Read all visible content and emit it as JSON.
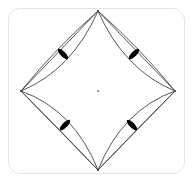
{
  "diagram": {
    "type": "geometric-figure",
    "vertices": {
      "top": [
        98,
        11
      ],
      "right": [
        175,
        91
      ],
      "bottom": [
        98,
        170
      ],
      "left": [
        21,
        91
      ]
    },
    "center_point": [
      98,
      91
    ],
    "lens_markers": [
      {
        "position": "top-left",
        "center": [
          63,
          54
        ]
      },
      {
        "position": "top-right",
        "center": [
          134,
          54
        ]
      },
      {
        "position": "bottom-left",
        "center": [
          65,
          125
        ]
      },
      {
        "position": "bottom-right",
        "center": [
          132,
          125
        ]
      }
    ],
    "colors": {
      "line": "#444444",
      "fill": "#000000",
      "frame_border": "#e6e6e6",
      "background": "#ffffff"
    }
  }
}
